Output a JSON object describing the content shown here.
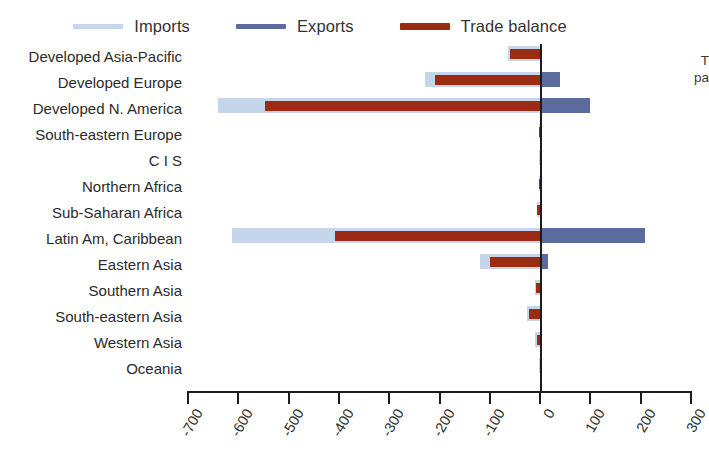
{
  "figure": {
    "top_caption_fragment": "",
    "right_note_line1": "T",
    "right_note_line2": "pa"
  },
  "legend": {
    "position": "top-center",
    "items": [
      {
        "label": "Imports",
        "color": "#c5d6ea",
        "name": "legend-imports"
      },
      {
        "label": "Exports",
        "color": "#5b6b9e",
        "name": "legend-exports"
      },
      {
        "label": "Trade balance",
        "color": "#9c2a14",
        "name": "legend-trade-balance"
      }
    ]
  },
  "chart_data": {
    "type": "bar",
    "orientation": "horizontal",
    "title": "",
    "xlabel": "",
    "ylabel": "",
    "xlim": [
      -700,
      300
    ],
    "xticks": [
      -700,
      -600,
      -500,
      -400,
      -300,
      -200,
      -100,
      0,
      100,
      200,
      300
    ],
    "xtick_labels": [
      "-700",
      "-600",
      "-500",
      "-400",
      "-300",
      "-200",
      "-100",
      "0",
      "100",
      "200",
      "300"
    ],
    "grid": false,
    "zero_line": 0,
    "legend_position": "top-center",
    "categories": [
      "Developed Asia-Pacific",
      "Developed Europe",
      "Developed N. America",
      "South-eastern Europe",
      "C I S",
      "Northern Africa",
      "Sub-Saharan Africa",
      "Latin Am, Caribbean",
      "Eastern Asia",
      "Southern Asia",
      "South-eastern Asia",
      "Western Asia",
      "Oceania"
    ],
    "series": [
      {
        "name": "Imports",
        "color": "#c5d6ea",
        "values": [
          -63,
          -228,
          -640,
          -3,
          -2,
          -3,
          -6,
          -612,
          -119,
          -11,
          -26,
          -10,
          -2
        ]
      },
      {
        "name": "Exports",
        "color": "#5b6b9e",
        "values": [
          3,
          40,
          100,
          2,
          1,
          2,
          3,
          209,
          15,
          2,
          4,
          3,
          1
        ]
      },
      {
        "name": "Trade balance",
        "color": "#9c2a14",
        "values": [
          -60,
          -208,
          -547,
          -2,
          -1,
          -2,
          -6,
          -408,
          -100,
          -9,
          -22,
          -7,
          -1
        ]
      }
    ]
  }
}
